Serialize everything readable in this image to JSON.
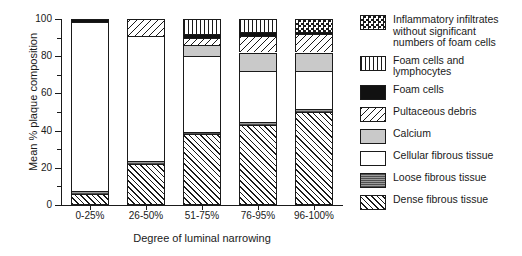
{
  "chart_data": {
    "type": "bar",
    "subtype": "stacked-bar-100-percent",
    "title": "",
    "xlabel": "Degree of luminal narrowing",
    "ylabel": "Mean % plaque composition",
    "categories": [
      "0-25%",
      "26-50%",
      "51-75%",
      "76-95%",
      "96-100%"
    ],
    "ylim": [
      0,
      100
    ],
    "yticks": [
      0,
      20,
      40,
      60,
      80,
      100
    ],
    "yticks_minor": [
      10,
      30,
      50,
      70,
      90
    ],
    "grid": false,
    "legend_position": "right",
    "series": [
      {
        "name": "Dense fibrous tissue",
        "key": "dense-fibrous-tissue",
        "pattern": "diagonal-hatch-up",
        "values": [
          6,
          22,
          38,
          43,
          50
        ]
      },
      {
        "name": "Loose fibrous tissue",
        "key": "loose-fibrous-tissue",
        "pattern": "solid-gray-dark",
        "values": [
          1.5,
          1.5,
          1.5,
          1.5,
          1.5
        ]
      },
      {
        "name": "Cellular fibrous tissue",
        "key": "cellular-fibrous-tissue",
        "pattern": "solid-white",
        "values": [
          91,
          67.5,
          40.5,
          27.5,
          20.5
        ]
      },
      {
        "name": "Calcium",
        "key": "calcium",
        "pattern": "solid-gray-light",
        "values": [
          0,
          0,
          6,
          10,
          10
        ]
      },
      {
        "name": "Pultaceous debris",
        "key": "pultaceous-debris",
        "pattern": "diagonal-hatch-down",
        "values": [
          0,
          9,
          4,
          9,
          10
        ]
      },
      {
        "name": "Foam cells",
        "key": "foam-cells",
        "pattern": "solid-black",
        "values": [
          1.5,
          0,
          2,
          2,
          1
        ]
      },
      {
        "name": "Foam cells and lymphocytes",
        "key": "foam-cells-and-lymphocytes",
        "pattern": "vertical-stripes",
        "values": [
          0,
          0,
          8,
          7,
          0
        ]
      },
      {
        "name": "Inflammatory infiltrates without significant numbers of foam cells",
        "key": "inflammatory-infiltrates",
        "pattern": "checkerboard",
        "values": [
          0,
          0,
          0,
          0,
          7
        ]
      }
    ]
  },
  "axes": {
    "y_title": "Mean % plaque composition",
    "x_title": "Degree of luminal narrowing",
    "y_tick_labels": [
      "100",
      "80",
      "60",
      "40",
      "20",
      "0"
    ]
  },
  "legend": {
    "items": [
      {
        "label": "Inflammatory infiltrates\nwithout significant\nnumbers of foam cells",
        "key": "inflammatory-infiltrates"
      },
      {
        "label": "Foam cells and lymphocytes",
        "key": "foam-cells-and-lymphocytes"
      },
      {
        "label": "Foam cells",
        "key": "foam-cells"
      },
      {
        "label": "Pultaceous debris",
        "key": "pultaceous-debris"
      },
      {
        "label": "Calcium",
        "key": "calcium"
      },
      {
        "label": "Cellular fibrous tissue",
        "key": "cellular-fibrous-tissue"
      },
      {
        "label": "Loose fibrous tissue",
        "key": "loose-fibrous-tissue"
      },
      {
        "label": "Dense fibrous tissue",
        "key": "dense-fibrous-tissue"
      }
    ]
  },
  "colors": {
    "ink": "#1a1a1a",
    "background": "#ffffff",
    "calcium_gray": "#c9c9c9",
    "loose_gray": "#7a7a7a",
    "foam_black": "#111111"
  }
}
